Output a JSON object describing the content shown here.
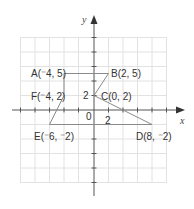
{
  "diagram": {
    "type": "coordinate-plane-polygon",
    "axes": {
      "x_label": "x",
      "y_label": "y",
      "origin_label": "0",
      "x_tick_label": "2",
      "y_tick_label": "2",
      "grid_step_units": 2,
      "x_range": [
        -10,
        10
      ],
      "y_range": [
        -10,
        10
      ]
    },
    "polygon": {
      "vertices": [
        {
          "name": "A",
          "x": -4,
          "y": 5,
          "label": "A(⁻4, 5)"
        },
        {
          "name": "B",
          "x": 2,
          "y": 5,
          "label": "B(2, 5)"
        },
        {
          "name": "C",
          "x": 0,
          "y": 2,
          "label": "C(0, 2)"
        },
        {
          "name": "D",
          "x": 8,
          "y": -2,
          "label": "D(8, ⁻2)"
        },
        {
          "name": "E",
          "x": -6,
          "y": -2,
          "label": "E(⁻6, ⁻2)"
        },
        {
          "name": "F",
          "x": -4,
          "y": 2,
          "label": "F(⁻4, 2)"
        }
      ],
      "order": [
        "A",
        "B",
        "C",
        "D",
        "E",
        "F"
      ]
    },
    "colors": {
      "grid": "#e2e2e2",
      "axis": "#555555",
      "polygon": "#8a8a8a",
      "text": "#333333"
    }
  }
}
